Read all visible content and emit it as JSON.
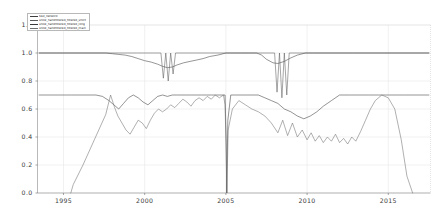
{
  "chart_data": {
    "type": "line",
    "title": "",
    "xlabel": "",
    "ylabel": "",
    "xlim": [
      1993.4,
      2017.6
    ],
    "ylim": [
      0.0,
      1.2
    ],
    "grid": true,
    "legend_position": "upper left",
    "xtick_labels": [
      "1995",
      "2000",
      "2005",
      "2010",
      "2015"
    ],
    "xtick_values": [
      1995,
      2000,
      2005,
      2010,
      2015
    ],
    "ytick_labels": [
      "0.0",
      "0.2",
      "0.4",
      "0.6",
      "0.8",
      "1.0",
      "1.2"
    ],
    "ytick_values": [
      0.0,
      0.2,
      0.4,
      0.6,
      0.8,
      1.0,
      1.2
    ],
    "series": [
      {
        "name": "test_network",
        "color": "#3f3f3f",
        "x": [
          1993.5,
          1995.0,
          1996.5,
          1997.6,
          1998.0,
          1998.4,
          1998.8,
          1999.2,
          1999.6,
          2000.0,
          2000.4,
          2000.8,
          2001.1,
          2001.4,
          2001.7,
          2002.0,
          2002.4,
          2002.8,
          2003.2,
          2003.6,
          2004.0,
          2004.5,
          2005.0,
          2005.4,
          2005.9,
          2006.4,
          2006.9,
          2007.2,
          2007.5,
          2007.9,
          2008.2,
          2008.6,
          2009.0,
          2009.4,
          2009.9,
          2010.4,
          2011.0,
          2011.6,
          2012.2,
          2012.8,
          2013.4,
          2014.0,
          2014.8,
          2015.6,
          2016.4,
          2017.5
        ],
        "y": [
          1.0,
          1.0,
          1.0,
          1.0,
          0.995,
          0.99,
          0.985,
          0.975,
          0.96,
          0.945,
          0.935,
          0.92,
          0.905,
          0.895,
          0.9,
          0.915,
          0.93,
          0.94,
          0.95,
          0.96,
          0.975,
          0.985,
          1.0,
          1.0,
          1.0,
          1.0,
          1.0,
          0.985,
          0.955,
          0.93,
          0.925,
          0.94,
          0.965,
          0.985,
          1.0,
          1.0,
          1.0,
          1.0,
          1.0,
          1.0,
          1.0,
          1.0,
          1.0,
          1.0,
          1.0,
          1.0
        ]
      },
      {
        "name": "snow_handfiltered_filtered_short",
        "color": "#5a5a5a",
        "x": [
          1993.5,
          1996.0,
          1998.0,
          1999.5,
          2000.5,
          2001.0,
          2001.15,
          2001.3,
          2001.45,
          2001.6,
          2001.75,
          2001.9,
          2002.1,
          2003.0,
          2004.0,
          2005.0,
          2006.0,
          2007.0,
          2008.0,
          2008.15,
          2008.3,
          2008.45,
          2008.6,
          2008.75,
          2008.9,
          2009.2,
          2010.0,
          2011.5,
          2013.0,
          2014.5,
          2016.0,
          2017.5
        ],
        "y": [
          1.0,
          1.0,
          1.0,
          1.0,
          1.0,
          1.0,
          0.82,
          1.0,
          0.8,
          1.0,
          0.85,
          1.0,
          1.0,
          1.0,
          1.0,
          1.0,
          1.0,
          1.0,
          1.0,
          0.72,
          1.0,
          0.68,
          1.0,
          0.7,
          1.0,
          1.0,
          1.0,
          1.0,
          1.0,
          1.0,
          1.0,
          1.0
        ]
      },
      {
        "name": "snow_handfiltered_filtered_long",
        "color": "#3a3a3a",
        "x": [
          1993.5,
          1995.5,
          1997.0,
          1997.4,
          1997.8,
          1998.1,
          1998.4,
          1998.7,
          1999.0,
          1999.3,
          1999.6,
          1999.9,
          2000.2,
          2000.5,
          2000.8,
          2001.1,
          2001.4,
          2001.7,
          2002.0,
          2002.3,
          2002.6,
          2002.9,
          2003.2,
          2003.5,
          2003.8,
          2004.1,
          2004.4,
          2004.7,
          2004.95,
          2005.02,
          2005.05,
          2005.12,
          2005.3,
          2005.6,
          2006.0,
          2006.5,
          2007.0,
          2007.4,
          2007.8,
          2008.2,
          2008.6,
          2009.0,
          2009.4,
          2009.8,
          2010.2,
          2010.6,
          2011.0,
          2011.5,
          2012.0,
          2012.6,
          2013.2,
          2013.8,
          2014.4,
          2015.0,
          2016.0,
          2017.5
        ],
        "y": [
          0.7,
          0.7,
          0.7,
          0.69,
          0.66,
          0.63,
          0.6,
          0.64,
          0.68,
          0.7,
          0.68,
          0.65,
          0.63,
          0.66,
          0.69,
          0.7,
          0.69,
          0.7,
          0.7,
          0.7,
          0.7,
          0.7,
          0.7,
          0.7,
          0.7,
          0.7,
          0.7,
          0.7,
          0.7,
          0.36,
          0.0,
          0.52,
          0.7,
          0.7,
          0.7,
          0.7,
          0.7,
          0.68,
          0.66,
          0.64,
          0.6,
          0.58,
          0.55,
          0.53,
          0.55,
          0.58,
          0.62,
          0.66,
          0.7,
          0.7,
          0.7,
          0.7,
          0.7,
          0.7,
          0.7,
          0.7
        ]
      },
      {
        "name": "snow_handfiltered_filtered_main",
        "color": "#6e6e6e",
        "x": [
          1995.45,
          1995.6,
          1996.2,
          1996.9,
          1997.6,
          1997.9,
          1998.15,
          1998.35,
          1998.6,
          1998.85,
          1999.1,
          1999.35,
          1999.6,
          1999.85,
          2000.1,
          2000.35,
          2000.6,
          2000.85,
          2001.1,
          2001.35,
          2001.6,
          2001.85,
          2002.1,
          2002.35,
          2002.6,
          2002.85,
          2003.1,
          2003.35,
          2003.6,
          2003.85,
          2004.1,
          2004.35,
          2004.6,
          2004.85,
          2004.95,
          2005.02,
          2005.06,
          2005.14,
          2005.4,
          2005.8,
          2006.2,
          2006.6,
          2007.0,
          2007.4,
          2007.8,
          2008.2,
          2008.5,
          2008.8,
          2009.1,
          2009.4,
          2009.7,
          2010.0,
          2010.25,
          2010.5,
          2010.75,
          2011.0,
          2011.25,
          2011.5,
          2011.75,
          2012.0,
          2012.25,
          2012.5,
          2012.75,
          2013.0,
          2013.3,
          2013.6,
          2013.9,
          2014.2,
          2014.6,
          2015.0,
          2015.4,
          2015.8,
          2016.15,
          2016.5
        ],
        "y": [
          0.0,
          0.06,
          0.2,
          0.38,
          0.56,
          0.7,
          0.61,
          0.55,
          0.5,
          0.45,
          0.42,
          0.47,
          0.52,
          0.5,
          0.46,
          0.52,
          0.57,
          0.6,
          0.58,
          0.6,
          0.63,
          0.61,
          0.64,
          0.67,
          0.65,
          0.62,
          0.66,
          0.68,
          0.66,
          0.69,
          0.67,
          0.7,
          0.68,
          0.7,
          0.63,
          0.3,
          0.0,
          0.45,
          0.6,
          0.66,
          0.63,
          0.6,
          0.58,
          0.55,
          0.5,
          0.43,
          0.52,
          0.41,
          0.5,
          0.4,
          0.45,
          0.38,
          0.43,
          0.37,
          0.41,
          0.36,
          0.4,
          0.37,
          0.42,
          0.36,
          0.39,
          0.35,
          0.4,
          0.37,
          0.44,
          0.52,
          0.6,
          0.66,
          0.7,
          0.68,
          0.6,
          0.38,
          0.12,
          0.0
        ]
      }
    ]
  },
  "legend": {
    "entries": [
      {
        "label": "test_network"
      },
      {
        "label": "snow_handfiltered_filtered_short"
      },
      {
        "label": "snow_handfiltered_filtered_long"
      },
      {
        "label": "snow_handfiltered_filtered_main"
      }
    ]
  }
}
